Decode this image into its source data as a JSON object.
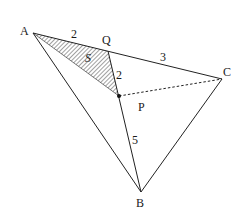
{
  "diagram": {
    "type": "geometry-triangle",
    "colors": {
      "stroke": "#222222",
      "hatch": "#444444",
      "background": "#ffffff"
    },
    "points": {
      "A": {
        "label": "A",
        "x": 33,
        "y": 33
      },
      "Q": {
        "label": "Q",
        "x": 108,
        "y": 51
      },
      "C": {
        "label": "C",
        "x": 222,
        "y": 79
      },
      "P": {
        "label": "P",
        "x": 119,
        "y": 96
      },
      "B": {
        "label": "B",
        "x": 141,
        "y": 192
      }
    },
    "segment_labels": {
      "AQ": "2",
      "QC": "3",
      "QP": "2",
      "PB": "5"
    },
    "region_label": "S",
    "shaded_region": "triangle AQP",
    "dashed_segment": "PC"
  }
}
